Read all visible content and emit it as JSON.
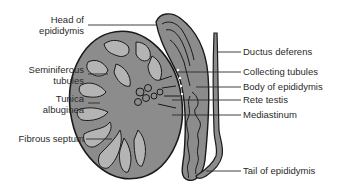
{
  "figure": {
    "colors": {
      "tissue_fill": "#8c8c8c",
      "tubule_fill": "#b4b4b4",
      "outline": "#1a1a1a",
      "leader_line": "#2a2a2a",
      "text": "#2a2a2a",
      "background": "#ffffff"
    },
    "labels_left": [
      {
        "id": "head-of-epididymis",
        "line1": "Head of",
        "line2": "epididymis"
      },
      {
        "id": "seminiferous-tubules",
        "line1": "Seminiferous",
        "line2": "tubules"
      },
      {
        "id": "tunica-albuginea",
        "line1": "Tunica",
        "line2": "albuginea"
      },
      {
        "id": "fibrous-septum",
        "line1": "Fibrous septum",
        "line2": ""
      }
    ],
    "labels_right": [
      {
        "id": "ductus-deferens",
        "text": "Ductus deferens"
      },
      {
        "id": "collecting-tubules",
        "text": "Collecting tubules"
      },
      {
        "id": "body-of-epididymis",
        "text": "Body of epididymis"
      },
      {
        "id": "rete-testis",
        "text": "Rete testis"
      },
      {
        "id": "mediastinum",
        "text": "Mediastinum"
      },
      {
        "id": "tail-of-epididymis",
        "text": "Tail of epididymis"
      }
    ]
  }
}
